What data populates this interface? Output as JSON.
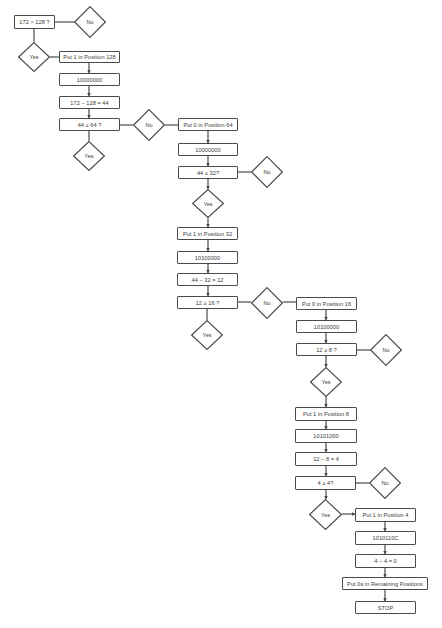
{
  "flowchart": {
    "title": "Decimal 172 to binary conversion flowchart",
    "boxes": [
      {
        "id": "b1",
        "label": "172 > 128 ?"
      },
      {
        "id": "b2",
        "label": "Put 1 in Position 128"
      },
      {
        "id": "b3",
        "label": "10000000"
      },
      {
        "id": "b4",
        "label": "172 − 128 = 44"
      },
      {
        "id": "b5",
        "label": "44 ≥ 64 ?"
      },
      {
        "id": "b6",
        "label": "Put 0 in Position 64"
      },
      {
        "id": "b7",
        "label": "10000000"
      },
      {
        "id": "b8",
        "label": "44 ≥ 32?"
      },
      {
        "id": "b9",
        "label": "Put 1 in Position 32"
      },
      {
        "id": "b10",
        "label": "10100000"
      },
      {
        "id": "b11",
        "label": "44 − 32 = 12"
      },
      {
        "id": "b12",
        "label": "12 ≥ 16 ?"
      },
      {
        "id": "b13",
        "label": "Put 0 in Position 16"
      },
      {
        "id": "b14",
        "label": "10100000"
      },
      {
        "id": "b15",
        "label": "12 ≥ 8 ?"
      },
      {
        "id": "b16",
        "label": "Put 1 in Position 8"
      },
      {
        "id": "b17",
        "label": "10101000"
      },
      {
        "id": "b18",
        "label": "12 − 8 = 4"
      },
      {
        "id": "b19",
        "label": "4 ≥ 4?"
      },
      {
        "id": "b20",
        "label": "Put 1 in Position 4"
      },
      {
        "id": "b21",
        "label": "1010110C"
      },
      {
        "id": "b22",
        "label": "4 − 4 = 0"
      },
      {
        "id": "b23",
        "label": "Put 0s in Remaining Positions"
      },
      {
        "id": "b24",
        "label": "STOP"
      }
    ],
    "decisions": [
      {
        "id": "d1",
        "label": "No"
      },
      {
        "id": "d2",
        "label": "Yes"
      },
      {
        "id": "d3",
        "label": "No"
      },
      {
        "id": "d4",
        "label": "Yes"
      },
      {
        "id": "d5",
        "label": "No"
      },
      {
        "id": "d6",
        "label": "Yes"
      },
      {
        "id": "d7",
        "label": "No"
      },
      {
        "id": "d8",
        "label": "Yes"
      },
      {
        "id": "d9",
        "label": "No"
      },
      {
        "id": "d10",
        "label": "Yes"
      },
      {
        "id": "d11",
        "label": "No"
      },
      {
        "id": "d12",
        "label": "Yes"
      }
    ],
    "colors": {
      "stroke": "#4a4a4a",
      "text": "#3a3a3a",
      "background": "#ffffff"
    }
  }
}
